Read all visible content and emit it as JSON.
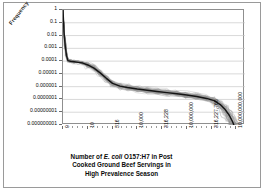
{
  "chart_data": {
    "type": "line",
    "title_lines": [
      {
        "pre": "Number of  ",
        "em": "E. coli",
        "post": " O157:H7 in Post"
      },
      {
        "pre": "Cooked Ground Beef Servings in",
        "em": "",
        "post": ""
      },
      {
        "pre": "High Prevalence Season",
        "em": "",
        "post": ""
      }
    ],
    "ylabel": "Frequency",
    "xlabel": "",
    "yscale": "log",
    "ylim": [
      1e-09,
      1
    ],
    "yticks": [
      1,
      0.1,
      0.01,
      0.001,
      0.0001,
      1e-05,
      1e-06,
      1e-07,
      1e-08,
      1e-09
    ],
    "ytick_labels": [
      "1",
      "0.1",
      "0.01",
      "0.001",
      "0.0001",
      "0.00001",
      "0.000001",
      "0.0000001",
      "0.00000001",
      "0.000000001"
    ],
    "xscale": "log-categorical",
    "xtick_labels": [
      "0",
      "10",
      "316",
      "10,000",
      "316,228",
      "10,000,000",
      "316,227,766",
      "10,000,000,000"
    ],
    "xtick_positions": [
      0,
      1,
      2,
      3,
      4,
      5,
      6,
      7
    ],
    "grid": "horizontal",
    "legend": "none",
    "series_count": 1,
    "band_description": "dense bundle of grey uncertainty-iteration curves around a bold black mean curve",
    "colors": {
      "mean_curve": "#1a1a1a",
      "band": "#8a8a8a",
      "gridline": "#c8c8c8",
      "axis": "#8f8f8f",
      "text": "#0a0a0a",
      "background": "#ffffff"
    },
    "series": [
      {
        "name": "Mean exceedance frequency",
        "x": [
          0.0,
          0.04,
          0.09,
          0.14,
          0.2,
          0.3,
          0.45,
          0.62,
          0.8,
          1.0,
          1.25,
          1.5,
          1.75,
          2.0,
          2.3,
          2.6,
          3.0,
          3.4,
          3.8,
          4.2,
          4.6,
          5.0,
          5.4,
          5.8,
          6.1,
          6.35,
          6.55,
          6.72,
          6.85,
          6.95,
          7.02
        ],
        "values": [
          1.0,
          0.02,
          0.0016,
          0.00028,
          0.00011,
          9.8e-05,
          9e-05,
          8e-05,
          7e-05,
          5e-05,
          2.8e-05,
          1.2e-05,
          4.5e-06,
          1.8e-06,
          1.1e-06,
          8.5e-07,
          6.5e-07,
          5.2e-07,
          4.2e-07,
          3.4e-07,
          2.8e-07,
          2.2e-07,
          1.7e-07,
          1.2e-07,
          8e-08,
          4e-08,
          1.6e-08,
          5.5e-09,
          1.8e-09,
          5.5e-10,
          2e-10
        ]
      }
    ]
  }
}
